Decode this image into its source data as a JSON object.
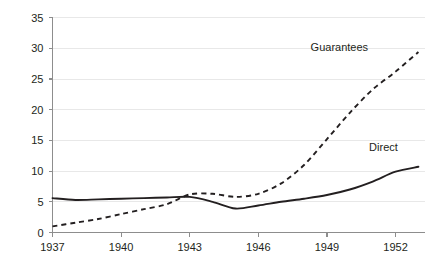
{
  "chart_data": {
    "type": "line",
    "title": "",
    "subtitle": "",
    "xlabel": "",
    "ylabel": "",
    "xlim": [
      1937,
      1953.3
    ],
    "ylim": [
      0,
      35
    ],
    "grid": true,
    "legend_position": "inline-end-of-line",
    "x_ticks": [
      "1937",
      "1940",
      "1943",
      "1946",
      "1949",
      "1952"
    ],
    "x_tick_values": [
      1937,
      1940,
      1943,
      1946,
      1949,
      1952
    ],
    "y_ticks": [
      "0",
      "5",
      "10",
      "15",
      "20",
      "25",
      "30",
      "35"
    ],
    "y_tick_values": [
      0,
      5,
      10,
      15,
      20,
      25,
      30,
      35
    ],
    "x": [
      1937,
      1938,
      1939,
      1940,
      1941,
      1942,
      1943,
      1944,
      1945,
      1946,
      1947,
      1948,
      1949,
      1950,
      1951,
      1952,
      1953
    ],
    "series": [
      {
        "name": "Direct",
        "style": "solid",
        "label": "Direct",
        "label_x": 1952.1,
        "label_y": 13.2,
        "values": [
          5.6,
          5.3,
          5.4,
          5.5,
          5.6,
          5.7,
          5.8,
          5.0,
          3.9,
          4.4,
          5.0,
          5.5,
          6.1,
          7.0,
          8.3,
          9.9,
          10.7
        ]
      },
      {
        "name": "Guarantees",
        "style": "dashed",
        "label": "Guarantees",
        "label_x": 1950.8,
        "label_y": 29.6,
        "values": [
          1.0,
          1.6,
          2.2,
          3.0,
          3.8,
          4.6,
          6.2,
          6.3,
          5.8,
          6.3,
          8.0,
          11.0,
          15.2,
          19.5,
          23.3,
          26.2,
          29.4
        ]
      }
    ]
  }
}
